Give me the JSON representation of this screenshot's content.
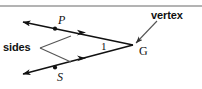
{
  "figure": {
    "background_color": "#ffffff",
    "stroke_color": "#111111",
    "rule_color": "#9a9a9a",
    "labels": {
      "point_p": "P",
      "point_s": "S",
      "vertex_point": "G",
      "angle_number": "1",
      "sides_callout": "sides",
      "vertex_callout": "vertex"
    },
    "geometry": {
      "vertex_xy": [
        134,
        45
      ],
      "ray_p_end_xy": [
        21,
        21
      ],
      "ray_s_end_xy": [
        21,
        75
      ],
      "point_p_dot_xy": [
        55,
        28
      ],
      "point_s_dot_xy": [
        55,
        68
      ],
      "sides_leader_origin_xy": [
        40,
        48
      ],
      "vertex_leader_origin_xy": [
        157,
        20
      ],
      "top_rule_y": 6
    }
  }
}
